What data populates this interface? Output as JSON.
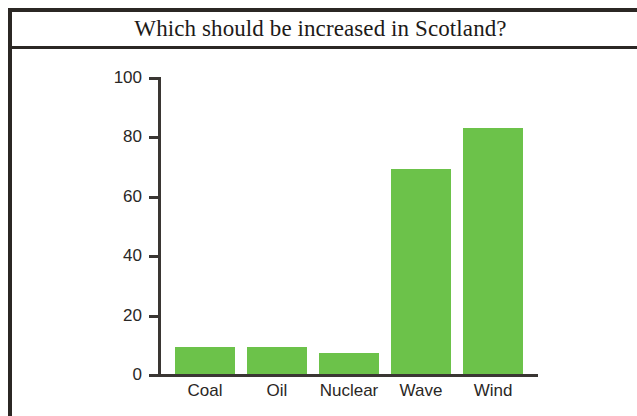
{
  "figure": {
    "title": "Which should be increased in Scotland?",
    "frame_color": "#2b2724",
    "background_color": "#ffffff"
  },
  "chart_data": {
    "type": "bar",
    "title": "Which should be increased in Scotland?",
    "categories": [
      "Coal",
      "Oil",
      "Nuclear",
      "Wave",
      "Wind"
    ],
    "values": [
      9,
      9,
      7,
      69,
      83
    ],
    "series": [
      {
        "name": "Should be increased",
        "values": [
          9,
          9,
          7,
          69,
          83
        ],
        "color": "#6cc24a"
      }
    ],
    "xlabel": "",
    "ylabel": "",
    "ylim": [
      0,
      100
    ],
    "yticks": [
      0,
      20,
      40,
      60,
      80,
      100
    ],
    "ytick_labels": [
      "0",
      "20",
      "40",
      "60",
      "80",
      "100"
    ],
    "grid": false,
    "legend": false,
    "bar_color": "#6cc24a",
    "axis_color": "#3a3633"
  }
}
